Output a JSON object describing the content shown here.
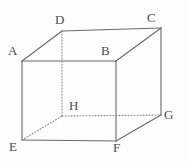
{
  "figure": {
    "name": "cube-diagram",
    "canvas": {
      "width": 187,
      "height": 162
    },
    "style": {
      "background_color": "#fdfdfd",
      "solid_edge_color": "#6a6a6a",
      "hidden_edge_color": "#8a8a8a",
      "label_color": "#4d4d4d",
      "edge_width": 1.1,
      "hidden_edge_dash": "1,2"
    },
    "vertices": [
      {
        "id": "A",
        "label": "A",
        "x": 22,
        "y": 61,
        "label_x": 8,
        "label_y": 44,
        "hidden": false
      },
      {
        "id": "B",
        "label": "B",
        "x": 116,
        "y": 61,
        "label_x": 101,
        "label_y": 44,
        "hidden": false
      },
      {
        "id": "C",
        "label": "C",
        "x": 161,
        "y": 28,
        "label_x": 147,
        "label_y": 11,
        "hidden": false
      },
      {
        "id": "D",
        "label": "D",
        "x": 62,
        "y": 31,
        "label_x": 55,
        "label_y": 13,
        "hidden": false
      },
      {
        "id": "E",
        "label": "E",
        "x": 22,
        "y": 140,
        "label_x": 9,
        "label_y": 140,
        "hidden": false
      },
      {
        "id": "F",
        "label": "F",
        "x": 116,
        "y": 141,
        "label_x": 113,
        "label_y": 141,
        "hidden": false
      },
      {
        "id": "G",
        "label": "G",
        "x": 161,
        "y": 115,
        "label_x": 164,
        "label_y": 108,
        "hidden": false
      },
      {
        "id": "H",
        "label": "H",
        "x": 62,
        "y": 116,
        "label_x": 69,
        "label_y": 99,
        "hidden": true
      }
    ],
    "solid_edges": [
      {
        "from": "A",
        "to": "B",
        "name": "edge-A-B"
      },
      {
        "from": "B",
        "to": "C",
        "name": "edge-B-C"
      },
      {
        "from": "C",
        "to": "D",
        "name": "edge-C-D"
      },
      {
        "from": "D",
        "to": "A",
        "name": "edge-D-A"
      },
      {
        "from": "A",
        "to": "E",
        "name": "edge-A-E"
      },
      {
        "from": "B",
        "to": "F",
        "name": "edge-B-F"
      },
      {
        "from": "C",
        "to": "G",
        "name": "edge-C-G"
      },
      {
        "from": "E",
        "to": "F",
        "name": "edge-E-F"
      },
      {
        "from": "F",
        "to": "G",
        "name": "edge-F-G"
      }
    ],
    "hidden_edges": [
      {
        "from": "D",
        "to": "H",
        "name": "edge-D-H"
      },
      {
        "from": "H",
        "to": "G",
        "name": "edge-H-G"
      },
      {
        "from": "E",
        "to": "H",
        "name": "edge-E-H"
      }
    ]
  }
}
